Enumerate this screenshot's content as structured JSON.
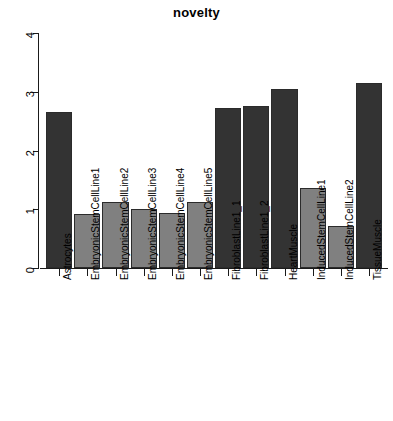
{
  "chart_data": {
    "type": "bar",
    "title": "novelty",
    "xlabel": "",
    "ylabel": "",
    "ylim": [
      0,
      4
    ],
    "yticks": [
      "0",
      "1",
      "2",
      "3",
      "4"
    ],
    "grid": false,
    "legend": "none",
    "categories": [
      "Astrocytes",
      "EmbryonicStemCellLine1",
      "EmbryonicStemCellLine2",
      "EmbryonicStemCellLine3",
      "EmbryonicStemCellLine4",
      "EmbryonicStemCellLine5",
      "FibroblastLine1_1",
      "FibroblastLine1_2",
      "HeartMuscle",
      "InducedStemCellLine1",
      "InducedStemCellLine2",
      "TissueMuscle"
    ],
    "values": [
      2.66,
      0.92,
      1.12,
      1.01,
      0.94,
      1.13,
      2.73,
      2.76,
      3.04,
      1.36,
      0.71,
      3.15
    ],
    "bar_colors": [
      "#333333",
      "#808080",
      "#808080",
      "#808080",
      "#808080",
      "#808080",
      "#333333",
      "#333333",
      "#333333",
      "#808080",
      "#808080",
      "#333333"
    ],
    "colors": {
      "dark": "#333333",
      "light": "#808080",
      "axis": "#1a1a1a",
      "background": "#ffffff",
      "text": "#000000"
    }
  }
}
